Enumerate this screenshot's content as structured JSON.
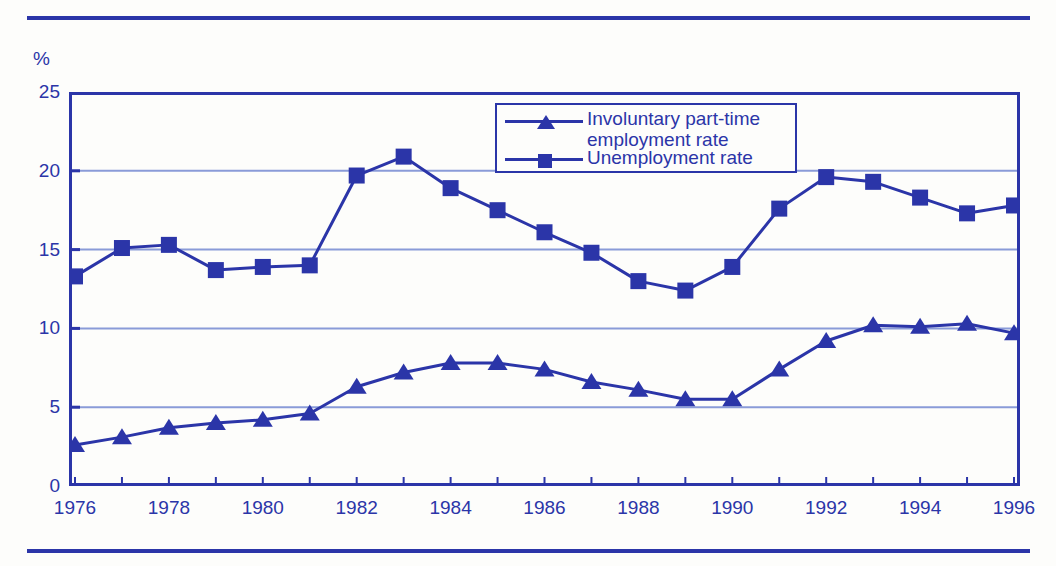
{
  "chart_data": {
    "type": "line",
    "title": "",
    "xlabel": "",
    "ylabel": "%",
    "ylim": [
      0,
      25
    ],
    "yticks": [
      0,
      5,
      10,
      15,
      20,
      25
    ],
    "xlim": [
      1976,
      1996
    ],
    "xticks_labeled": [
      1976,
      1978,
      1980,
      1982,
      1984,
      1986,
      1988,
      1990,
      1992,
      1994,
      1996
    ],
    "x": [
      1976,
      1977,
      1978,
      1979,
      1980,
      1981,
      1982,
      1983,
      1984,
      1985,
      1986,
      1987,
      1988,
      1989,
      1990,
      1991,
      1992,
      1993,
      1994,
      1995,
      1996
    ],
    "grid": true,
    "grid_axis": "y",
    "legend_position": "top-center",
    "series": [
      {
        "name": "Involuntary part-time employment rate",
        "marker": "triangle",
        "color": "#2b35a8",
        "values": [
          2.6,
          3.1,
          3.7,
          4.0,
          4.2,
          4.6,
          6.3,
          7.2,
          7.8,
          7.8,
          7.4,
          6.6,
          6.1,
          5.5,
          5.5,
          7.4,
          9.2,
          10.2,
          10.1,
          10.3,
          9.7
        ]
      },
      {
        "name": "Unemployment rate",
        "marker": "square",
        "color": "#2b35a8",
        "values": [
          13.3,
          15.1,
          15.3,
          13.7,
          13.9,
          14.0,
          19.7,
          20.9,
          18.9,
          17.5,
          16.1,
          14.8,
          13.0,
          12.4,
          13.9,
          17.6,
          19.6,
          19.3,
          18.3,
          17.3,
          17.8
        ]
      }
    ]
  },
  "axis": {
    "unit_label": "%",
    "y_tick_labels": [
      "25",
      "20",
      "15",
      "10",
      "5",
      "0"
    ],
    "x_tick_labels": [
      "1976",
      "1978",
      "1980",
      "1982",
      "1984",
      "1986",
      "1988",
      "1990",
      "1992",
      "1994",
      "1996"
    ]
  },
  "legend": {
    "entries": [
      {
        "label": "Involuntary part-time\nemployment rate",
        "marker": "triangle"
      },
      {
        "label": "Unemployment rate",
        "marker": "square"
      }
    ]
  },
  "colors": {
    "accent": "#2b35a8",
    "grid": "#8a9bd8",
    "background": "#fdfdfb"
  }
}
